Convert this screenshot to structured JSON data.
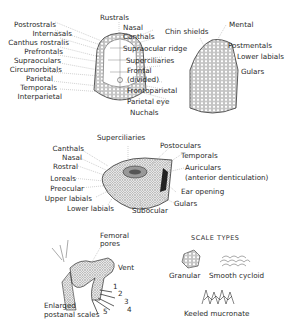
{
  "figure": {
    "dorsal_head": {
      "labels_left": [
        "Postrostrals",
        "Internasals",
        "Canthus rostralis",
        "Prefrontals",
        "Supraoculars",
        "Circumorbitals",
        "Parietal",
        "Temporals",
        "Interparietal"
      ],
      "label_top": "Rustrals",
      "labels_right": [
        "Nasal",
        "Canthals",
        "Supraocular ridge",
        "Superciliaries",
        "Frontal",
        "(divided)",
        "Frontoparietal",
        "Parietal eye",
        "Nuchals"
      ]
    },
    "ventral_head": {
      "labels": [
        "Chin shields",
        "Mental",
        "Postmentals",
        "Lower labials",
        "Gulars"
      ]
    },
    "lateral_head": {
      "labels": [
        "Superciliaries",
        "Canthals",
        "Nasal",
        "Rostral",
        "Loreals",
        "Preocular",
        "Upper labials",
        "Lower labials",
        "Subocular",
        "Postoculars",
        "Temporals",
        "Auriculars",
        "(anterior denticulation)",
        "Ear opening",
        "Gulars"
      ]
    },
    "hindlimb": {
      "labels": [
        "Femoral",
        "pores",
        "Vent",
        "Enlarged",
        "postanal scales"
      ],
      "toe_numbers": [
        "1",
        "2",
        "3",
        "4",
        "5"
      ]
    },
    "scale_types": {
      "title": "SCALE TYPES",
      "items": [
        "Granular",
        "Smooth cycloid",
        "Keeled mucronate"
      ]
    }
  }
}
